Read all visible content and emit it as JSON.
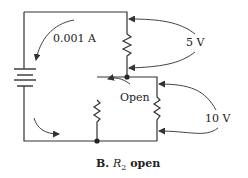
{
  "diagram": {
    "type": "circuit",
    "labels": {
      "current": "0.001 A",
      "voltage_top": "5 V",
      "voltage_bottom": "10 V",
      "open": "Open"
    },
    "caption": {
      "prefix": "B. ",
      "var": "R",
      "sub": "2",
      "suffix": " open"
    },
    "components": [
      {
        "id": "battery",
        "kind": "battery"
      },
      {
        "id": "R1",
        "kind": "resistor",
        "position": "upper-right"
      },
      {
        "id": "R2",
        "kind": "resistor",
        "position": "lower-left",
        "state": "open"
      },
      {
        "id": "R3",
        "kind": "resistor",
        "position": "lower-right"
      }
    ],
    "colors": {
      "line": "#333333",
      "background": "#ffffff"
    }
  }
}
